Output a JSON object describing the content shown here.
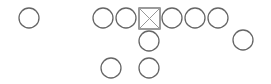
{
  "diagram": {
    "type": "football-formation",
    "stroke_color": "#666666",
    "background": "#ffffff",
    "players": [
      {
        "id": "split-end-left",
        "shape": "circle",
        "cx": 29,
        "cy": 18,
        "r": 10
      },
      {
        "id": "left-tackle",
        "shape": "circle",
        "cx": 103,
        "cy": 18,
        "r": 10
      },
      {
        "id": "left-guard",
        "shape": "circle",
        "cx": 126,
        "cy": 18,
        "r": 10
      },
      {
        "id": "center",
        "shape": "square-x",
        "x": 139,
        "y": 8,
        "size": 21
      },
      {
        "id": "right-guard",
        "shape": "circle",
        "cx": 172,
        "cy": 18,
        "r": 10
      },
      {
        "id": "right-tackle",
        "shape": "circle",
        "cx": 195,
        "cy": 18,
        "r": 10
      },
      {
        "id": "tight-end",
        "shape": "circle",
        "cx": 218,
        "cy": 18,
        "r": 10
      },
      {
        "id": "quarterback",
        "shape": "circle",
        "cx": 149,
        "cy": 41,
        "r": 10
      },
      {
        "id": "flanker-right",
        "shape": "circle",
        "cx": 243,
        "cy": 40,
        "r": 10
      },
      {
        "id": "halfback",
        "shape": "circle",
        "cx": 111,
        "cy": 68,
        "r": 10
      },
      {
        "id": "fullback",
        "shape": "circle",
        "cx": 149,
        "cy": 68,
        "r": 10
      }
    ]
  }
}
